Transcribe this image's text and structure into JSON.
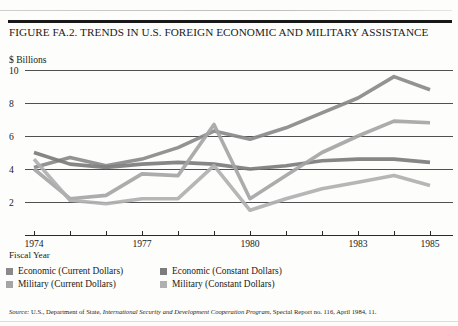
{
  "document": {
    "figure_title": "FIGURE FA.2. TRENDS IN U.S. FOREIGN ECONOMIC AND MILITARY ASSISTANCE",
    "scan_ghost_text": "",
    "source_prefix": "Source:",
    "source_part1": " U.S., Department of State, ",
    "source_italic": "International Security and Development Cooperation Program,",
    "source_part2": " Special Report no. 116, April 1984, 11."
  },
  "axis": {
    "y_title": "$ Billions",
    "x_title": "Fiscal Year"
  },
  "legend": {
    "items": [
      {
        "label": "Economic (Current Dollars)",
        "color": "#8a8a8a",
        "column": 1
      },
      {
        "label": "Military (Current Dollars)",
        "color": "#a5a5a5",
        "column": 1
      },
      {
        "label": "Economic (Constant Dollars)",
        "color": "#7c7c7c",
        "column": 2
      },
      {
        "label": "Military (Constant Dollars)",
        "color": "#b0b0b0",
        "column": 2
      }
    ]
  },
  "chart_data": {
    "type": "line",
    "title": "FIGURE FA.2. TRENDS IN U.S. FOREIGN ECONOMIC AND MILITARY ASSISTANCE",
    "xlabel": "Fiscal Year",
    "ylabel": "$ Billions",
    "ylim": [
      0,
      10.6
    ],
    "yticks": [
      2,
      4,
      6,
      8,
      10
    ],
    "ytick_labels": [
      "2",
      "4",
      "6",
      "8",
      "10"
    ],
    "grid": true,
    "legend_position": "below-axis",
    "x": [
      1974,
      1975,
      1976,
      1977,
      1978,
      1979,
      1980,
      1981,
      1982,
      1983,
      1984,
      1985
    ],
    "xlim": [
      1974,
      1985
    ],
    "xticks": [
      1974,
      1975,
      1976,
      1977,
      1978,
      1979,
      1980,
      1981,
      1982,
      1983,
      1984,
      1985
    ],
    "xtick_labels": [
      "1974",
      "",
      "",
      "1977",
      "",
      "",
      "1980",
      "",
      "",
      "1983",
      "",
      "1985"
    ],
    "series": [
      {
        "name": "Economic (Current Dollars)",
        "color": "#8a8a8a",
        "values": [
          4.1,
          4.7,
          4.2,
          4.6,
          5.3,
          6.3,
          5.8,
          6.5,
          7.4,
          8.3,
          9.6,
          8.8
        ]
      },
      {
        "name": "Economic (Constant Dollars)",
        "color": "#7c7c7c",
        "values": [
          5.0,
          4.3,
          4.1,
          4.3,
          4.4,
          4.3,
          4.0,
          4.2,
          4.5,
          4.6,
          4.6,
          4.4
        ]
      },
      {
        "name": "Military (Current Dollars)",
        "color": "#a5a5a5",
        "values": [
          4.0,
          2.2,
          2.4,
          3.7,
          3.6,
          6.7,
          2.2,
          3.6,
          5.0,
          6.0,
          6.9,
          6.8
        ]
      },
      {
        "name": "Military (Constant Dollars)",
        "color": "#b0b0b0",
        "values": [
          4.6,
          2.1,
          1.9,
          2.2,
          2.2,
          4.2,
          1.5,
          2.2,
          2.8,
          3.2,
          3.6,
          3.0
        ]
      }
    ]
  }
}
